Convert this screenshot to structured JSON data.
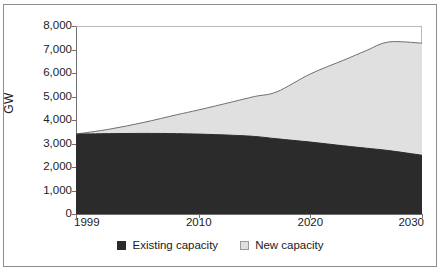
{
  "figure": {
    "title_fragment": "",
    "axis_title_y": "GW"
  },
  "legend": {
    "items": [
      {
        "label": "Existing capacity",
        "color": "#2b2b2b",
        "swatch": "filled-square"
      },
      {
        "label": "New capacity",
        "color": "#e0e0e0",
        "swatch": "outlined-square"
      }
    ]
  },
  "colors": {
    "existing_capacity": "#2b2b2b",
    "new_capacity": "#e0e0e0",
    "series_line": "#6f6f6f",
    "axis": "#6f6f6f",
    "frame": "#8e8e8e",
    "background": "#ffffff"
  },
  "chart_data": {
    "type": "area",
    "stacked": true,
    "title": "",
    "xlabel": "",
    "ylabel": "GW",
    "xlim": [
      1999,
      2030
    ],
    "ylim": [
      0,
      8000
    ],
    "ytick_labels": [
      "8,000",
      "7,000",
      "6,000",
      "5,000",
      "4,000",
      "3,000",
      "2,000",
      "1,000",
      "0"
    ],
    "ytick_values": [
      8000,
      7000,
      6000,
      5000,
      4000,
      3000,
      2000,
      1000,
      0
    ],
    "xtick_labels": [
      "1999",
      "2010",
      "2020",
      "2030"
    ],
    "xtick_values": [
      1999,
      2010,
      2020,
      2030
    ],
    "grid": false,
    "legend_position": "bottom-center",
    "x": [
      1999,
      2002,
      2005,
      2008,
      2010,
      2013,
      2015,
      2017,
      2020,
      2023,
      2025,
      2027,
      2030
    ],
    "series": [
      {
        "name": "Existing capacity",
        "values": [
          3400,
          3420,
          3430,
          3420,
          3400,
          3350,
          3300,
          3200,
          3060,
          2900,
          2800,
          2700,
          2500
        ]
      },
      {
        "name": "New capacity",
        "values": [
          0,
          190,
          460,
          800,
          1030,
          1420,
          1700,
          2000,
          2900,
          3650,
          4150,
          4620,
          4770
        ]
      }
    ],
    "total": [
      3400,
      3610,
      3890,
      4220,
      4430,
      4770,
      5000,
      5200,
      5960,
      6550,
      6950,
      7320,
      7270
    ]
  }
}
